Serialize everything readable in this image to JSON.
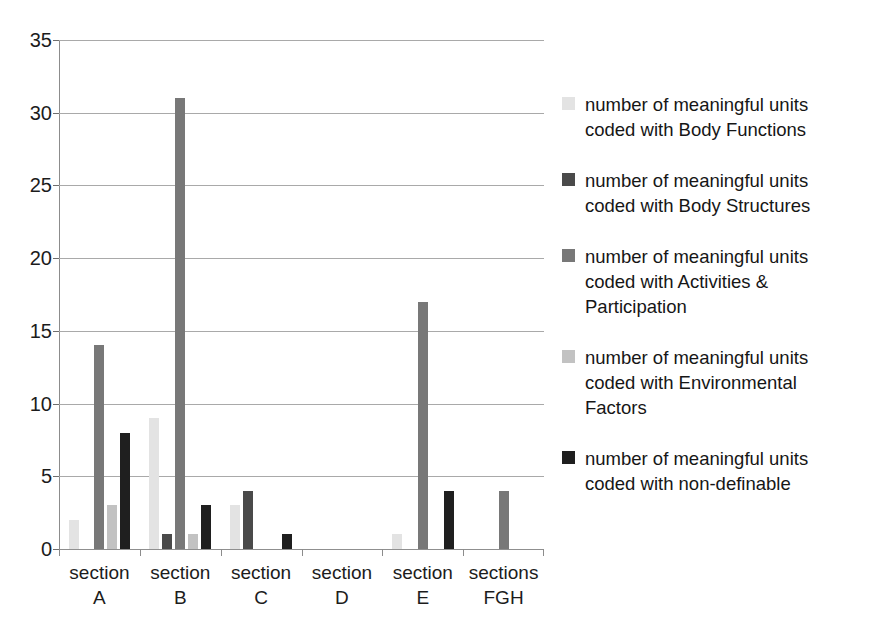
{
  "chart_data": {
    "type": "bar",
    "title": "",
    "subtitle": "",
    "xlabel": "",
    "ylabel": "",
    "ylim": [
      0,
      35
    ],
    "ytick_step": 5,
    "yticks": [
      0,
      5,
      10,
      15,
      20,
      25,
      30,
      35
    ],
    "grid": true,
    "legend_position": "right",
    "categories": [
      "section A",
      "section B",
      "section C",
      "section D",
      "section E",
      "sections FGH"
    ],
    "category_lines": [
      [
        "section",
        "A"
      ],
      [
        "section",
        "B"
      ],
      [
        "section",
        "C"
      ],
      [
        "section",
        "D"
      ],
      [
        "section",
        "E"
      ],
      [
        "sections",
        "FGH"
      ]
    ],
    "series": [
      {
        "name": "number of meaningful units coded with Body Functions",
        "color": "#e3e3e3",
        "values": [
          2,
          9,
          3,
          0,
          1,
          0
        ]
      },
      {
        "name": "number of meaningful units coded with Body Structures",
        "color": "#4a4a4a",
        "values": [
          0,
          1,
          4,
          0,
          0,
          0
        ]
      },
      {
        "name": "number of meaningful units coded with Activities & Participation",
        "color": "#787878",
        "values": [
          14,
          31,
          0,
          0,
          17,
          4
        ]
      },
      {
        "name": "number of meaningful units coded with Environmental Factors",
        "color": "#c2c2c2",
        "values": [
          3,
          1,
          0,
          0,
          0,
          0
        ]
      },
      {
        "name": "number of meaningful units coded with non-definable",
        "color": "#1f1f1f",
        "values": [
          8,
          3,
          1,
          0,
          4,
          0
        ]
      }
    ]
  },
  "legend": {
    "items": [
      {
        "label": "number of meaningful units coded with Body Functions",
        "lines": [
          "number of meaningful units",
          "coded with Body Functions"
        ],
        "color": "#e3e3e3"
      },
      {
        "label": "number of meaningful units coded with Body Structures",
        "lines": [
          "number of meaningful units",
          "coded with Body Structures"
        ],
        "color": "#4a4a4a"
      },
      {
        "label": "number of meaningful units coded with Activities & Participation",
        "lines": [
          "number of meaningful units",
          "coded with Activities &",
          "Participation"
        ],
        "color": "#787878"
      },
      {
        "label": "number of meaningful units coded with Environmental Factors",
        "lines": [
          "number of meaningful units",
          "coded with Environmental",
          "Factors"
        ],
        "color": "#c2c2c2"
      },
      {
        "label": "number of meaningful units coded with non-definable",
        "lines": [
          "number of meaningful units",
          "coded with non-definable"
        ],
        "color": "#1f1f1f"
      }
    ]
  },
  "axis": {
    "y_tick_labels": [
      "35",
      "30",
      "25",
      "20",
      "15",
      "10",
      "5",
      "0"
    ]
  },
  "colors": {
    "background": "#ffffff",
    "gridline": "#a9a9a9",
    "axis": "#8c8c8c",
    "text": "#1a1a1a"
  }
}
